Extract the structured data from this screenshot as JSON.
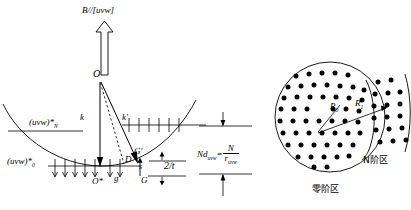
{
  "figure": {
    "title_label": "B//[uvw]",
    "left_panel": {
      "origin_label": "O",
      "origin_star_label": "O*",
      "incident_beam_label": "k",
      "diffracted_beam_label": "k'",
      "deviation_point_label": "D",
      "reciprocal_point_label": "G",
      "reciprocal_point_prime_label": "G'",
      "reciprocal_vector_label": "g",
      "excitation_error_label": "s",
      "rel_rod_length_label": "2/t",
      "zone_N_label": "(uvw)*",
      "zone_N_sub": "N",
      "zone_N_sup": "*",
      "zone_0_label": "(uvw)*",
      "zone_0_sub": "0",
      "zone_0_sup": "*",
      "spacing_formula_left": "Nd",
      "spacing_formula_sub": "uvw",
      "spacing_formula_sup": "*",
      "spacing_formula_eq": "=",
      "spacing_formula_num": "N",
      "spacing_formula_den_r": "r",
      "spacing_formula_den_sub": "uvw"
    },
    "right_panel": {
      "radius_inner_label": "R",
      "radius_inner_sub": "0",
      "radius_outer_label": "R",
      "radius_outer_sub": "1",
      "zero_order_zone_label": "零阶区",
      "n_order_zone_label": "N阶区"
    },
    "colors": {
      "stroke": "#000000",
      "background": "#ffffff"
    }
  }
}
